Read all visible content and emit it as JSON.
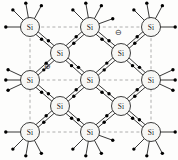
{
  "figure": {
    "name": "silicon-crystal-lattice",
    "background_color": "#fdfdfc",
    "width": 178,
    "height": 160
  },
  "atoms": {
    "symbol": "Si",
    "circle_fill": "#f7f7f5",
    "circle_stroke": "#1a1a1a",
    "radius": 9.5,
    "positions": [
      {
        "id": "si-r1c1",
        "x": 30,
        "y": 27,
        "row": 1,
        "col": 1
      },
      {
        "id": "si-r1c2",
        "x": 90,
        "y": 27,
        "row": 1,
        "col": 2
      },
      {
        "id": "si-r1c3",
        "x": 151,
        "y": 27,
        "row": 1,
        "col": 3
      },
      {
        "id": "si-r2c1",
        "x": 60,
        "y": 53,
        "row": 2,
        "col": 1
      },
      {
        "id": "si-r2c2",
        "x": 121,
        "y": 53,
        "row": 2,
        "col": 2
      },
      {
        "id": "si-r3c1",
        "x": 30,
        "y": 80,
        "row": 3,
        "col": 1
      },
      {
        "id": "si-r3c2",
        "x": 90,
        "y": 80,
        "row": 3,
        "col": 2
      },
      {
        "id": "si-r3c3",
        "x": 151,
        "y": 80,
        "row": 3,
        "col": 3
      },
      {
        "id": "si-r4c1",
        "x": 60,
        "y": 106,
        "row": 4,
        "col": 1
      },
      {
        "id": "si-r4c2",
        "x": 121,
        "y": 106,
        "row": 4,
        "col": 2
      },
      {
        "id": "si-r5c1",
        "x": 30,
        "y": 132,
        "row": 5,
        "col": 1
      },
      {
        "id": "si-r5c2",
        "x": 90,
        "y": 132,
        "row": 5,
        "col": 2
      },
      {
        "id": "si-r5c3",
        "x": 151,
        "y": 132,
        "row": 5,
        "col": 3
      }
    ]
  },
  "bonds": {
    "stroke": "#141414",
    "stroke_width": 0.85,
    "offset": 1.7,
    "electron_color": "#000000",
    "electron_radius": 1.7,
    "pairs": [
      {
        "from": "si-r1c1",
        "to": "si-r2c1"
      },
      {
        "from": "si-r1c2",
        "to": "si-r2c1"
      },
      {
        "from": "si-r1c2",
        "to": "si-r2c2"
      },
      {
        "from": "si-r1c3",
        "to": "si-r2c2"
      },
      {
        "from": "si-r3c1",
        "to": "si-r2c1"
      },
      {
        "from": "si-r3c2",
        "to": "si-r2c1"
      },
      {
        "from": "si-r3c2",
        "to": "si-r2c2"
      },
      {
        "from": "si-r3c3",
        "to": "si-r2c2"
      },
      {
        "from": "si-r3c1",
        "to": "si-r4c1"
      },
      {
        "from": "si-r3c2",
        "to": "si-r4c1"
      },
      {
        "from": "si-r3c2",
        "to": "si-r4c2"
      },
      {
        "from": "si-r3c3",
        "to": "si-r4c2"
      },
      {
        "from": "si-r5c1",
        "to": "si-r4c1"
      },
      {
        "from": "si-r5c2",
        "to": "si-r4c1"
      },
      {
        "from": "si-r5c2",
        "to": "si-r4c2"
      },
      {
        "from": "si-r5c3",
        "to": "si-r4c2"
      }
    ],
    "dangling": [
      {
        "atom": "si-r1c1",
        "angle": -135
      },
      {
        "atom": "si-r1c1",
        "angle": -100
      },
      {
        "atom": "si-r1c1",
        "angle": -62
      },
      {
        "atom": "si-r1c1",
        "angle": 180
      },
      {
        "atom": "si-r1c2",
        "angle": -135
      },
      {
        "atom": "si-r1c2",
        "angle": -100
      },
      {
        "atom": "si-r1c2",
        "angle": -62
      },
      {
        "atom": "si-r1c2",
        "angle": -20
      },
      {
        "atom": "si-r1c3",
        "angle": -135
      },
      {
        "atom": "si-r1c3",
        "angle": -100
      },
      {
        "atom": "si-r1c3",
        "angle": -62
      },
      {
        "atom": "si-r1c3",
        "angle": 0
      },
      {
        "atom": "si-r3c1",
        "angle": 180
      },
      {
        "atom": "si-r3c1",
        "angle": -155
      },
      {
        "atom": "si-r3c1",
        "angle": 155
      },
      {
        "atom": "si-r3c3",
        "angle": 0
      },
      {
        "atom": "si-r3c3",
        "angle": -25
      },
      {
        "atom": "si-r3c3",
        "angle": 25
      },
      {
        "atom": "si-r5c1",
        "angle": 180
      },
      {
        "atom": "si-r5c1",
        "angle": 135
      },
      {
        "atom": "si-r5c1",
        "angle": 100
      },
      {
        "atom": "si-r5c1",
        "angle": 62
      },
      {
        "atom": "si-r5c2",
        "angle": 135
      },
      {
        "atom": "si-r5c2",
        "angle": 100
      },
      {
        "atom": "si-r5c2",
        "angle": 62
      },
      {
        "atom": "si-r5c2",
        "angle": 20
      },
      {
        "atom": "si-r5c3",
        "angle": 0
      },
      {
        "atom": "si-r5c3",
        "angle": 135
      },
      {
        "atom": "si-r5c3",
        "angle": 100
      },
      {
        "atom": "si-r5c3",
        "angle": 62
      }
    ]
  },
  "guide_lines": {
    "color": "#9a9a9a",
    "dash": "3,2.6",
    "stroke_width": 0.8,
    "horizontal": [
      {
        "x1": 30,
        "x2": 151,
        "y": 27
      },
      {
        "x1": 30,
        "x2": 151,
        "y": 80
      },
      {
        "x1": 30,
        "x2": 151,
        "y": 132
      }
    ],
    "vertical": [
      {
        "y1": 27,
        "y2": 132,
        "x": 30
      },
      {
        "y1": 27,
        "y2": 132,
        "x": 151
      }
    ]
  },
  "charges": [
    {
      "id": "negative-charge",
      "name": "free-electron-charge",
      "glyph": "⊖",
      "symbol": "minus",
      "x": 118,
      "y": 32,
      "color": "#2a2a2a"
    },
    {
      "id": "positive-charge",
      "name": "hole-charge",
      "glyph": "⊕",
      "symbol": "plus",
      "x": 47,
      "y": 66,
      "color": "#2a2a2a"
    }
  ]
}
